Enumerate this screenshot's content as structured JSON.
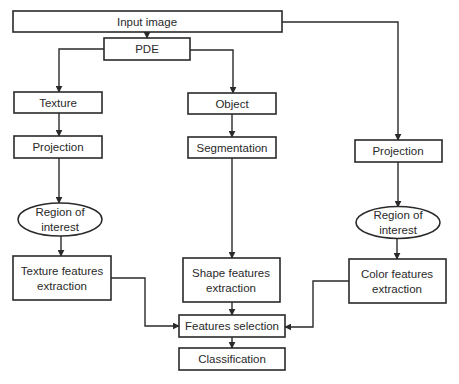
{
  "diagram": {
    "type": "flowchart",
    "nodes": {
      "input_image": {
        "label": "Input image",
        "shape": "rect"
      },
      "pde": {
        "label": "PDE",
        "shape": "rect"
      },
      "texture": {
        "label": "Texture",
        "shape": "rect"
      },
      "object": {
        "label": "Object",
        "shape": "rect"
      },
      "projection_left": {
        "label": "Projection",
        "shape": "rect"
      },
      "segmentation": {
        "label": "Segmentation",
        "shape": "rect"
      },
      "projection_right": {
        "label": "Projection",
        "shape": "rect"
      },
      "roi_left": {
        "label_line1": "Region of",
        "label_line2": "interest",
        "shape": "ellipse"
      },
      "roi_right": {
        "label_line1": "Region of",
        "label_line2": "interest",
        "shape": "ellipse"
      },
      "texture_features": {
        "label_line1": "Texture features",
        "label_line2": "extraction",
        "shape": "rect"
      },
      "shape_features": {
        "label_line1": "Shape features",
        "label_line2": "extraction",
        "shape": "rect"
      },
      "color_features": {
        "label_line1": "Color features",
        "label_line2": "extraction",
        "shape": "rect"
      },
      "features_selection": {
        "label": "Features selection",
        "shape": "rect"
      },
      "classification": {
        "label": "Classification",
        "shape": "rect"
      }
    },
    "edges": [
      {
        "from": "input_image",
        "to": "pde"
      },
      {
        "from": "input_image",
        "to": "projection_right"
      },
      {
        "from": "pde",
        "to": "texture"
      },
      {
        "from": "pde",
        "to": "object"
      },
      {
        "from": "texture",
        "to": "projection_left"
      },
      {
        "from": "object",
        "to": "segmentation"
      },
      {
        "from": "projection_left",
        "to": "roi_left"
      },
      {
        "from": "projection_right",
        "to": "roi_right"
      },
      {
        "from": "roi_left",
        "to": "texture_features"
      },
      {
        "from": "segmentation",
        "to": "shape_features"
      },
      {
        "from": "roi_right",
        "to": "color_features"
      },
      {
        "from": "texture_features",
        "to": "features_selection"
      },
      {
        "from": "shape_features",
        "to": "features_selection"
      },
      {
        "from": "color_features",
        "to": "features_selection"
      },
      {
        "from": "features_selection",
        "to": "classification"
      }
    ]
  }
}
